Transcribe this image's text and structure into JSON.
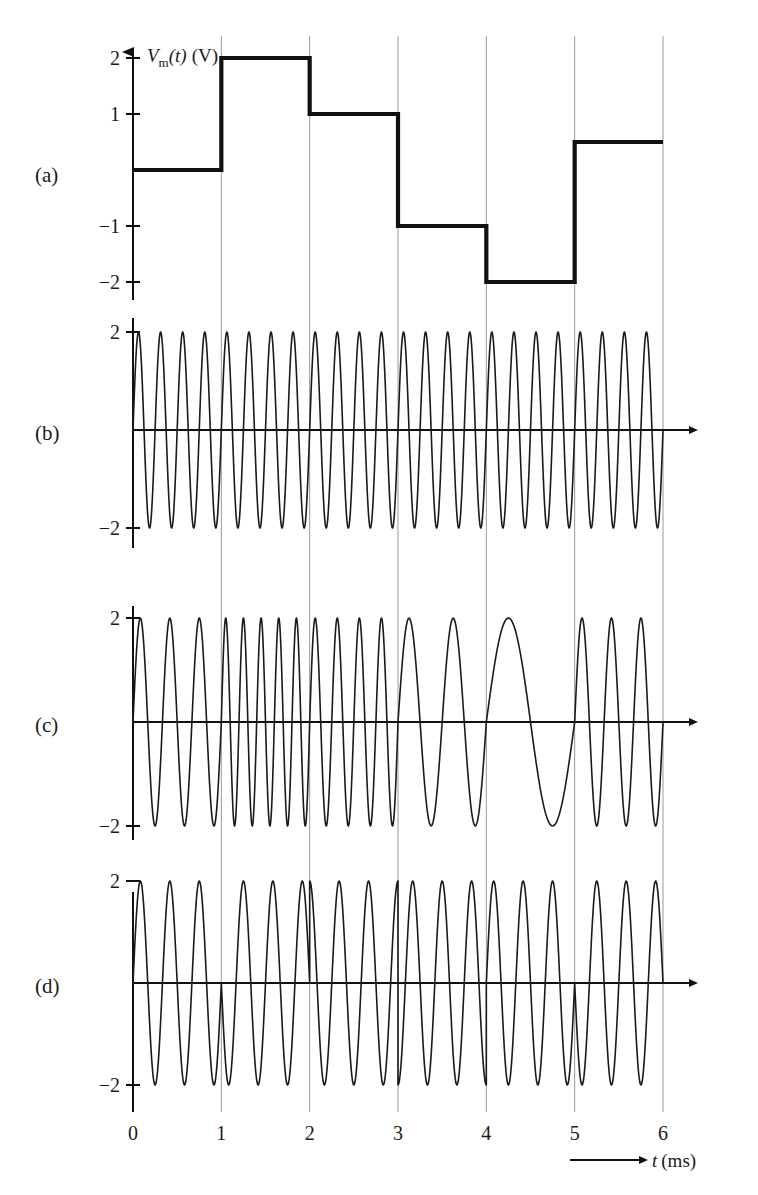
{
  "figure": {
    "panels": [
      {
        "id": "a",
        "label": "(a)",
        "kind": "message",
        "caption": ""
      },
      {
        "id": "b",
        "label": "(b)",
        "kind": "ask",
        "caption": ""
      },
      {
        "id": "c",
        "label": "(c)",
        "kind": "fsk",
        "caption": ""
      },
      {
        "id": "d",
        "label": "(d)",
        "kind": "psk",
        "caption": ""
      }
    ],
    "x_axis": {
      "label_symbol": "t",
      "label_unit": "(ms)",
      "ticks": [
        "0",
        "1",
        "2",
        "3",
        "4",
        "5",
        "6"
      ],
      "tick_values": [
        0,
        1,
        2,
        3,
        4,
        5,
        6
      ],
      "min": 0,
      "max": 6
    },
    "y_axis_message": {
      "label_symbol": "V",
      "label_subscript": "m",
      "label_arg": "(t)",
      "label_unit": "(V)",
      "ticks": [
        "2",
        "1",
        "-1",
        "-2"
      ],
      "tick_values": [
        2,
        1,
        -1,
        -2
      ],
      "min": -2,
      "max": 2
    },
    "y_axis_carrier": {
      "ticks": [
        "2",
        "-2"
      ],
      "tick_values": [
        2,
        -2
      ],
      "min": -2,
      "max": 2
    },
    "colors": {
      "ink": "#1a1a1a",
      "grid": "#9a9a9a",
      "background": "#ffffff"
    }
  },
  "chart_data": {
    "type": "line",
    "xlabel": "t (ms)",
    "ylabel": "Vm(t) (V)",
    "xlim": [
      0,
      6
    ],
    "ylim": [
      -2,
      2
    ],
    "grid": "vertical-only",
    "legend": "none",
    "charts": [
      {
        "panel": "a",
        "name": "message-signal",
        "type": "step",
        "ylabel": "Vm(t) (V)",
        "yticks": [
          2,
          1,
          -1,
          -2
        ],
        "x_edges": [
          0,
          1,
          2,
          3,
          4,
          5,
          6
        ],
        "values": [
          0,
          2,
          1,
          -1,
          -2,
          0.5
        ],
        "description": "Multilevel staircase message signal, one symbol per millisecond"
      },
      {
        "panel": "b",
        "name": "amplitude-modulated-carrier",
        "type": "sine",
        "yticks": [
          2,
          -2
        ],
        "amplitude": 2,
        "segments": [
          {
            "t0": 0,
            "t1": 1,
            "cycles": 4,
            "amplitude": 2,
            "phase_deg": 0
          },
          {
            "t0": 1,
            "t1": 2,
            "cycles": 4,
            "amplitude": 2,
            "phase_deg": 0
          },
          {
            "t0": 2,
            "t1": 3,
            "cycles": 4,
            "amplitude": 2,
            "phase_deg": 0
          },
          {
            "t0": 3,
            "t1": 4,
            "cycles": 4,
            "amplitude": 2,
            "phase_deg": 0
          },
          {
            "t0": 4,
            "t1": 5,
            "cycles": 4,
            "amplitude": 2,
            "phase_deg": 0
          },
          {
            "t0": 5,
            "t1": 6,
            "cycles": 4,
            "amplitude": 2,
            "phase_deg": 0
          }
        ],
        "description": "Constant-amplitude constant-frequency carrier reference"
      },
      {
        "panel": "c",
        "name": "frequency-shift-keyed-carrier",
        "type": "sine",
        "yticks": [
          2,
          -2
        ],
        "amplitude": 2,
        "segments": [
          {
            "t0": 0,
            "t1": 1,
            "cycles": 3,
            "amplitude": 2,
            "phase_deg": 0
          },
          {
            "t0": 1,
            "t1": 2,
            "cycles": 5,
            "amplitude": 2,
            "phase_deg": 0
          },
          {
            "t0": 2,
            "t1": 3,
            "cycles": 4,
            "amplitude": 2,
            "phase_deg": 0
          },
          {
            "t0": 3,
            "t1": 4,
            "cycles": 2,
            "amplitude": 2,
            "phase_deg": 0
          },
          {
            "t0": 4,
            "t1": 5,
            "cycles": 1,
            "amplitude": 2,
            "phase_deg": 0
          },
          {
            "t0": 5,
            "t1": 6,
            "cycles": 3,
            "amplitude": 2,
            "phase_deg": 0
          }
        ],
        "description": "Frequency shift keying: carrier frequency tracks the message level"
      },
      {
        "panel": "d",
        "name": "phase-shift-keyed-carrier",
        "type": "sine",
        "yticks": [
          2,
          -2
        ],
        "amplitude": 2,
        "segments": [
          {
            "t0": 0,
            "t1": 1,
            "cycles": 3,
            "amplitude": 2,
            "phase_deg": 0
          },
          {
            "t0": 1,
            "t1": 2,
            "cycles": 3,
            "amplitude": 2,
            "phase_deg": 180
          },
          {
            "t0": 2,
            "t1": 3,
            "cycles": 3,
            "amplitude": 2,
            "phase_deg": 90
          },
          {
            "t0": 3,
            "t1": 4,
            "cycles": 3,
            "amplitude": 2,
            "phase_deg": 270
          },
          {
            "t0": 4,
            "t1": 5,
            "cycles": 3,
            "amplitude": 2,
            "phase_deg": 0
          },
          {
            "t0": 5,
            "t1": 6,
            "cycles": 3,
            "amplitude": 2,
            "phase_deg": 180
          }
        ],
        "description": "Phase shift keying: carrier phase jumps at each symbol boundary"
      }
    ]
  }
}
